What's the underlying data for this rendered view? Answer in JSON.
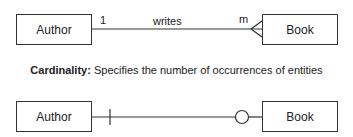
{
  "diagram_1": {
    "left_entity": "Author",
    "right_entity": "Book",
    "relationship": "writes",
    "left_cardinality": "1",
    "right_cardinality": "m",
    "right_end_symbol": "crows-foot"
  },
  "caption": {
    "term": "Cardinality:",
    "description": "Specifies the number of occurrences of entities"
  },
  "diagram_2": {
    "left_entity": "Author",
    "right_entity": "Book",
    "left_end_symbol": "one-bar",
    "right_end_symbol": "zero-circle"
  },
  "colors": {
    "line": "#333333",
    "text": "#222222",
    "background": "#ffffff"
  }
}
